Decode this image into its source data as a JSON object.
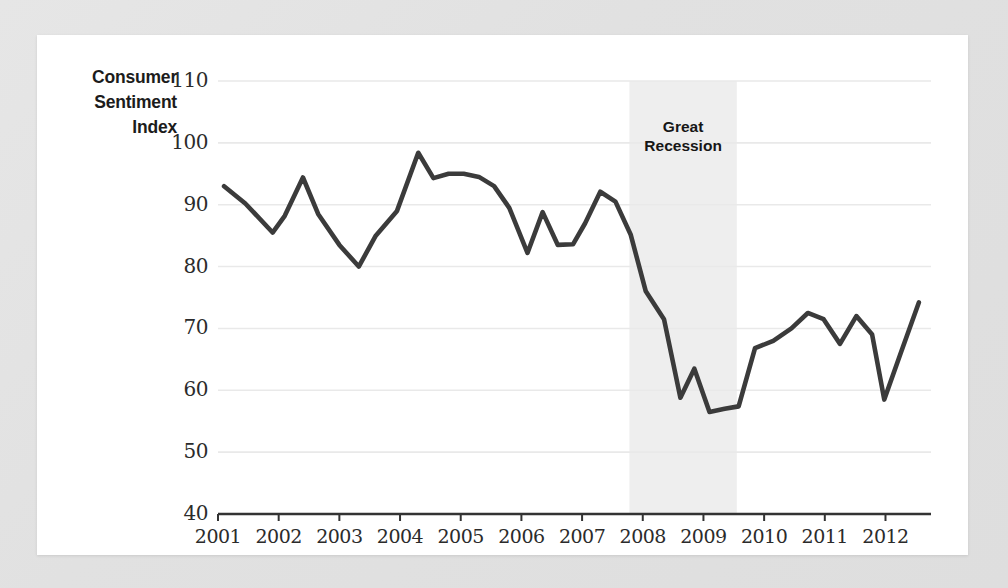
{
  "chart_data": {
    "type": "line",
    "title": "",
    "ylabel": "Consumer Sentiment Index",
    "ylabel_lines": [
      "Consumer",
      "Sentiment",
      "Index"
    ],
    "xlabel": "",
    "ylim": [
      40,
      110
    ],
    "xlim": [
      2001,
      2012.75
    ],
    "yticks": [
      40,
      50,
      60,
      70,
      80,
      90,
      100,
      110
    ],
    "ytick_labels": [
      "40",
      "50",
      "60",
      "70",
      "80",
      "90",
      "100",
      "110"
    ],
    "xticks": [
      2001,
      2002,
      2003,
      2004,
      2005,
      2006,
      2007,
      2008,
      2009,
      2010,
      2011,
      2012
    ],
    "xtick_labels": [
      "2001",
      "2002",
      "2003",
      "2004",
      "2005",
      "2006",
      "2007",
      "2008",
      "2009",
      "2010",
      "2011",
      "2012"
    ],
    "grid": true,
    "grid_axis": "y",
    "legend": "none",
    "line_color": "#3b3b3b",
    "line_width": 4.6,
    "grid_color": "#e9e9e9",
    "axis_color": "#333333",
    "plot_background": "#ffffff",
    "page_background": "#e3e3e3",
    "annotations": [
      {
        "name": "great-recession-band",
        "label": "Great Recession",
        "label_lines": [
          "Great",
          "Recession"
        ],
        "x_start": 2007.78,
        "x_end": 2009.55,
        "shade_color": "#eeeeee"
      }
    ],
    "series": [
      {
        "name": "Consumer Sentiment Index",
        "x": [
          2001.1,
          2001.45,
          2001.9,
          2002.1,
          2002.4,
          2002.65,
          2003.0,
          2003.32,
          2003.6,
          2003.95,
          2004.3,
          2004.55,
          2004.8,
          2005.05,
          2005.3,
          2005.55,
          2005.8,
          2006.1,
          2006.35,
          2006.6,
          2006.85,
          2007.05,
          2007.3,
          2007.55,
          2007.8,
          2008.05,
          2008.35,
          2008.62,
          2008.85,
          2009.1,
          2009.35,
          2009.58,
          2009.85,
          2010.15,
          2010.45,
          2010.72,
          2010.98,
          2011.25,
          2011.52,
          2011.78,
          2011.98,
          2012.25,
          2012.55
        ],
        "values": [
          93.0,
          90.2,
          85.5,
          88.2,
          94.4,
          88.5,
          83.5,
          80.0,
          85.0,
          89.0,
          98.4,
          94.3,
          95.0,
          95.0,
          94.5,
          93.0,
          89.5,
          82.2,
          88.8,
          83.5,
          83.6,
          87.0,
          92.1,
          90.5,
          85.2,
          76.0,
          71.5,
          58.8,
          63.5,
          56.5,
          57.0,
          57.4,
          66.8,
          68.0,
          70.0,
          72.5,
          71.5,
          67.5,
          72.0,
          69.0,
          58.5,
          66.0,
          74.2
        ]
      }
    ]
  },
  "plot_geometry": {
    "left": 181,
    "top": 46,
    "right": 894,
    "bottom": 479
  }
}
